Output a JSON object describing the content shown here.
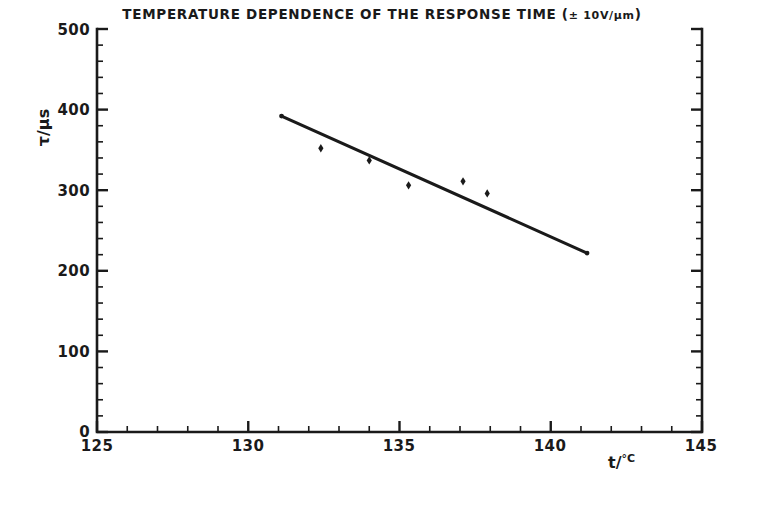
{
  "chart_data": {
    "type": "scatter",
    "title": "TEMPERATURE DEPENDENCE OF THE RESPONSE TIME (± 10V/µm)",
    "title_main": "TEMPERATURE DEPENDENCE OF THE RESPONSE TIME (",
    "title_condition": "± 10V/µm",
    "title_close": ")",
    "xlabel": "t/°C",
    "xlabel_text": "t/",
    "xlabel_unit": "°C",
    "ylabel": "τ/µs",
    "xlim": [
      125,
      145
    ],
    "ylim": [
      0,
      500
    ],
    "xticks": [
      125,
      130,
      135,
      140,
      145
    ],
    "xtick_labels": [
      "125",
      "130",
      "135",
      "140",
      "145"
    ],
    "yticks": [
      0,
      100,
      200,
      300,
      400,
      500
    ],
    "ytick_labels": [
      "0",
      "100",
      "200",
      "300",
      "400",
      "500"
    ],
    "x_minor_step": 1,
    "y_minor_step": 20,
    "grid": false,
    "legend": null,
    "marker": "diamond",
    "marker_color": "#1a1a1a",
    "line_color": "#1a1a1a",
    "frame_color": "#1a1a1a",
    "points": [
      {
        "x": 132.4,
        "y": 352
      },
      {
        "x": 134.0,
        "y": 337
      },
      {
        "x": 135.3,
        "y": 306
      },
      {
        "x": 137.1,
        "y": 311
      },
      {
        "x": 137.9,
        "y": 296
      }
    ],
    "series": [
      {
        "name": "response time",
        "x": [
          132.4,
          134.0,
          135.3,
          137.1,
          137.9
        ],
        "values": [
          352,
          337,
          306,
          311,
          296
        ]
      }
    ],
    "fit_line": {
      "name": "linear fit",
      "x": [
        131.1,
        141.2
      ],
      "values": [
        392,
        222
      ]
    }
  }
}
